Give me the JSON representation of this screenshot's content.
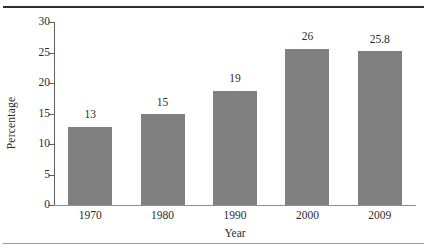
{
  "chart_data": {
    "type": "bar",
    "title": "",
    "subtitle": "",
    "xlabel": "Year",
    "ylabel": "Percentage",
    "categories": [
      "1970",
      "1980",
      "1990",
      "2000",
      "2009"
    ],
    "values": [
      13,
      15,
      19,
      26,
      25.8
    ],
    "value_labels": [
      "13",
      "15",
      "19",
      "26",
      "25.8"
    ],
    "bar_heights": [
      12.8,
      14.9,
      18.7,
      25.6,
      25.2
    ],
    "ylim": [
      0,
      30
    ],
    "ytick_labels": [
      "0",
      "5",
      "10",
      "15",
      "20",
      "25",
      "30"
    ],
    "ytick_values": [
      0,
      5,
      10,
      15,
      20,
      25,
      30
    ],
    "grid": false,
    "legend": false,
    "legend_position": "none",
    "bar_color": "#808080",
    "axis_color": "#5f5f61",
    "text_color": "#2b2b2b",
    "rule_top_color": "#2e2e30",
    "rule_bottom_color": "#9a9a9c"
  }
}
